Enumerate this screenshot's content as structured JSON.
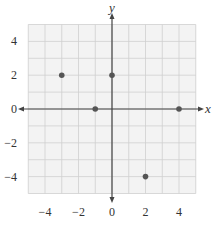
{
  "chart_data": {
    "type": "scatter",
    "title": "",
    "xlabel": "x",
    "ylabel": "y",
    "xlim": [
      -5,
      5
    ],
    "ylim": [
      -5,
      5
    ],
    "grid": true,
    "minor_grid_step": 1,
    "x_ticks": [
      -4,
      -2,
      0,
      2,
      4
    ],
    "y_ticks": [
      4,
      2,
      0,
      -2,
      -4
    ],
    "x_tick_labels": [
      "−4",
      "−2",
      "0",
      "2",
      "4"
    ],
    "y_tick_labels": [
      "4",
      "2",
      "0",
      "−2",
      "−4"
    ],
    "points": [
      {
        "x": -3,
        "y": 2
      },
      {
        "x": 0,
        "y": 2
      },
      {
        "x": -1,
        "y": 0
      },
      {
        "x": 4,
        "y": 0
      },
      {
        "x": 2,
        "y": -4
      }
    ],
    "colors": {
      "point": "#555555",
      "axis": "#444444",
      "grid": "#cfcfcf",
      "background": "#f3f3f3"
    }
  }
}
